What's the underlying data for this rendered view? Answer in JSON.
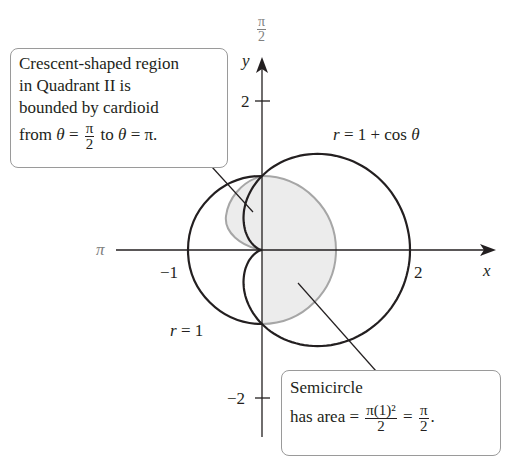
{
  "figure": {
    "type": "polar-area-diagram",
    "colors": {
      "curve": "#231f20",
      "semicircle_edge": "#a6a6a6",
      "shade": "#ececec",
      "axis": "#231f20",
      "callout_border": "#9a9a9a"
    }
  },
  "axes": {
    "x_label": "x",
    "y_label": "y",
    "pi_label": "π",
    "pi_over_2_num": "π",
    "pi_over_2_den": "2",
    "ticks": {
      "x_neg1": "−1",
      "x_2": "2",
      "y_2": "2",
      "y_neg2": "−2"
    }
  },
  "curves": {
    "cardioid_label": "r = 1 + cos θ",
    "circle_label": "r = 1"
  },
  "callouts": {
    "crescent": {
      "line1": "Crescent-shaped region",
      "line2": "in Quadrant II is",
      "line3": "bounded by cardioid",
      "line4_a": "from θ =",
      "line4_frac_num": "π",
      "line4_frac_den": "2",
      "line4_b": "to θ = π."
    },
    "semicircle": {
      "line1": "Semicircle",
      "line2_a": "has area =",
      "frac1_num": "π(1)²",
      "frac1_den": "2",
      "eq": "=",
      "frac2_num": "π",
      "frac2_den": "2",
      "end": "."
    }
  },
  "chart_data": {
    "type": "polar",
    "title": "",
    "curves": [
      {
        "name": "r = 1 + cos θ",
        "kind": "cardioid"
      },
      {
        "name": "r = 1",
        "kind": "circle"
      }
    ],
    "shaded_regions": [
      "crescent in Quadrant II between circle r=1 and cardioid, θ from π/2 to π",
      "semicircle (right half of r=1 circle) with area π/2"
    ],
    "x_ticks": [
      -1,
      2
    ],
    "y_ticks": [
      2,
      -2
    ],
    "polar_angle_labels": [
      "π/2",
      "π"
    ],
    "xlabel": "x",
    "ylabel": "y",
    "xlim": [
      -1.5,
      3.1
    ],
    "ylim": [
      -2.5,
      2.6
    ]
  }
}
